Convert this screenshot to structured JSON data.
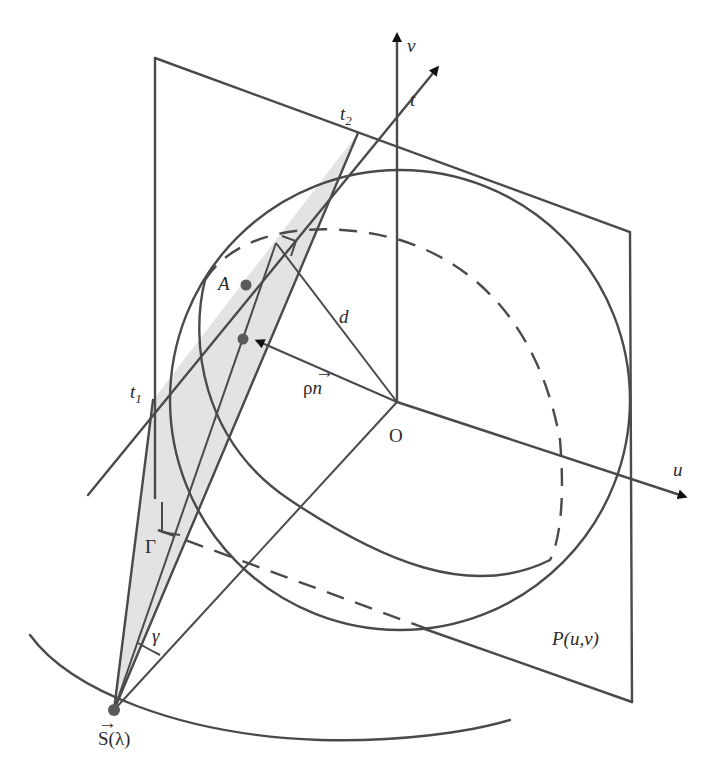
{
  "figure": {
    "colors": {
      "line": "#4a4a4a",
      "shade": "#e3e3e3",
      "point": "#5a5a5a",
      "arrow": "#111111",
      "text": "#2a2a2a"
    },
    "labels": {
      "v_axis": "v",
      "t_axis": "t",
      "t2": "t",
      "t2_sub": "2",
      "t1": "t",
      "t1_sub": "1",
      "A": "A",
      "d": "d",
      "rho_n": "ρ",
      "n_vec": "n",
      "O": "O",
      "u_axis": "u",
      "Gamma": "Γ",
      "gamma": "γ",
      "S_lambda": "S(λ)",
      "plane": "P(u,v)"
    }
  }
}
